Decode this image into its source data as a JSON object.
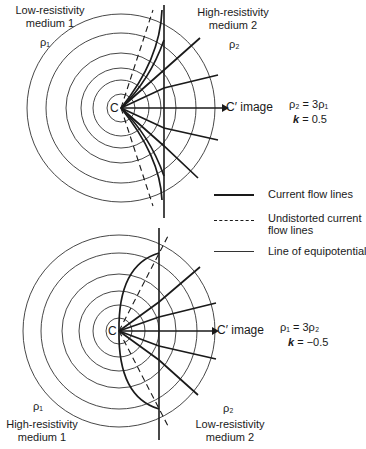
{
  "top_panel": {
    "medium1_label": [
      "Low-resistivity",
      "medium 1"
    ],
    "medium2_label": [
      "High-resistivity",
      "medium 2"
    ],
    "rho1": "ρ₁",
    "rho2": "ρ₂",
    "source": "C",
    "image_label": "C′ image",
    "relation": "ρ₂ = 3ρ₁",
    "k_label": "k",
    "k_value": "= 0.5"
  },
  "bottom_panel": {
    "medium1_label": [
      "High-resistivity",
      "medium 1"
    ],
    "medium2_label": [
      "Low-resistivity",
      "medium 2"
    ],
    "rho1": "ρ₁",
    "rho2": "ρ₂",
    "source": "C",
    "image_label": "C′ image",
    "relation": "ρ₁ = 3ρ₂",
    "k_label": "k",
    "k_value": "= −0.5"
  },
  "legend": {
    "current_flow": "Current flow lines",
    "undistorted": [
      "Undistorted current",
      "flow lines"
    ],
    "equipotential": "Line of equipotential"
  },
  "colors": {
    "line": "#1a1a1a",
    "background": "#ffffff"
  }
}
